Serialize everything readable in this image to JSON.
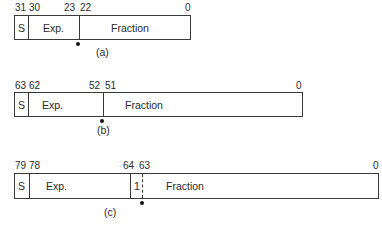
{
  "formats": [
    {
      "id": "a",
      "caption": "(a)",
      "bit_labels": [
        "31",
        "30",
        "23",
        "22",
        "0"
      ],
      "fields": [
        "S",
        "Exp.",
        "Fraction"
      ],
      "hidden_bit": ""
    },
    {
      "id": "b",
      "caption": "(b)",
      "bit_labels": [
        "63",
        "62",
        "52",
        "51",
        "0"
      ],
      "fields": [
        "S",
        "Exp.",
        "Fraction"
      ],
      "hidden_bit": ""
    },
    {
      "id": "c",
      "caption": "(c)",
      "bit_labels": [
        "79",
        "78",
        "64",
        "63",
        "0"
      ],
      "fields": [
        "S",
        "Exp.",
        "Fraction"
      ],
      "hidden_bit": "1"
    }
  ]
}
